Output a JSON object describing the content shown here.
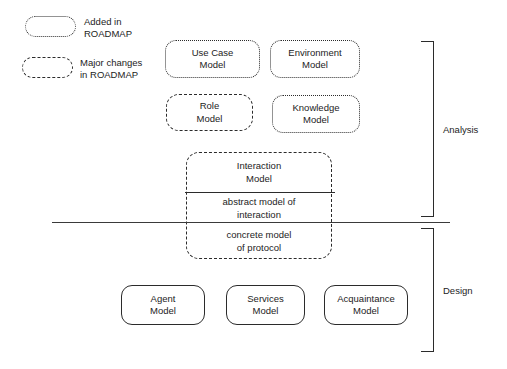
{
  "diagram": {
    "legend": {
      "items": [
        {
          "style": "dotted",
          "label_line_1": "Added in",
          "label_line_2": "ROADMAP"
        },
        {
          "style": "dashed",
          "label_line_1": "Major changes",
          "label_line_2": "in ROADMAP"
        }
      ]
    },
    "phases": [
      {
        "name": "Analysis"
      },
      {
        "name": "Design"
      }
    ],
    "analysis_nodes": [
      {
        "line1": "Use Case",
        "line2": "Model",
        "style": "dotted"
      },
      {
        "line1": "Environment",
        "line2": "Model",
        "style": "dotted"
      },
      {
        "line1": "Role",
        "line2": "Model",
        "style": "dashed"
      },
      {
        "line1": "Knowledge",
        "line2": "Model",
        "style": "dotted"
      }
    ],
    "interaction_model": {
      "style": "dashed",
      "compartments": [
        {
          "line1": "Interaction",
          "line2": "Model"
        },
        {
          "line1": "abstract model of",
          "line2": "interaction"
        },
        {
          "line1": "concrete model",
          "line2": "of protocol"
        }
      ]
    },
    "design_nodes": [
      {
        "line1": "Agent",
        "line2": "Model",
        "style": "solid"
      },
      {
        "line1": "Services",
        "line2": "Model",
        "style": "solid"
      },
      {
        "line1": "Acquaintance",
        "line2": "Model",
        "style": "solid"
      }
    ],
    "colors": {
      "stroke": "#2b2b2b",
      "text": "#1c1c1c",
      "background": "#ffffff"
    }
  }
}
